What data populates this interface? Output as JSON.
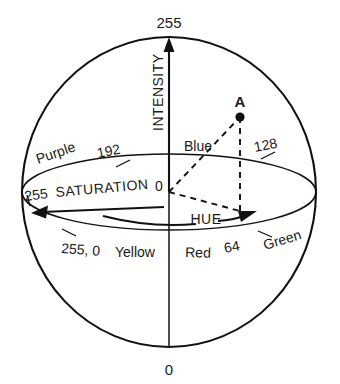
{
  "figure": {
    "type": "diagram",
    "background_color": "#ffffff",
    "line_color": "#111111"
  },
  "axis": {
    "name": "INTENSITY",
    "label": "INTENSITY",
    "top_value": "255",
    "bottom_value": "0",
    "direction": "vertical-up"
  },
  "saturation": {
    "label": "SATURATION",
    "max_value": "255",
    "min_value": "0",
    "arrow_direction": "left"
  },
  "hue": {
    "label": "HUE",
    "arrow_direction": "right-curved",
    "ticks": [
      {
        "value": "192",
        "name": "hue-tick-192"
      },
      {
        "value": "128",
        "name": "hue-tick-128"
      },
      {
        "value": "64",
        "name": "hue-tick-64"
      },
      {
        "value": "255, 0",
        "name": "hue-tick-255-0"
      }
    ],
    "colors": [
      {
        "name": "purple",
        "label": "Purple"
      },
      {
        "name": "blue",
        "label": "Blue"
      },
      {
        "name": "green",
        "label": "Green"
      },
      {
        "name": "yellow",
        "label": "Yellow"
      },
      {
        "name": "red",
        "label": "Red"
      }
    ]
  },
  "point": {
    "label": "A",
    "name": "point-a"
  }
}
